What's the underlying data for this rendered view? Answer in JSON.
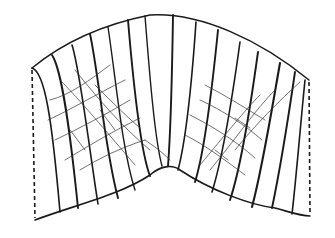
{
  "figure": {
    "colors": {
      "background": "#ffffff",
      "ink": "#1a1a1a"
    }
  }
}
